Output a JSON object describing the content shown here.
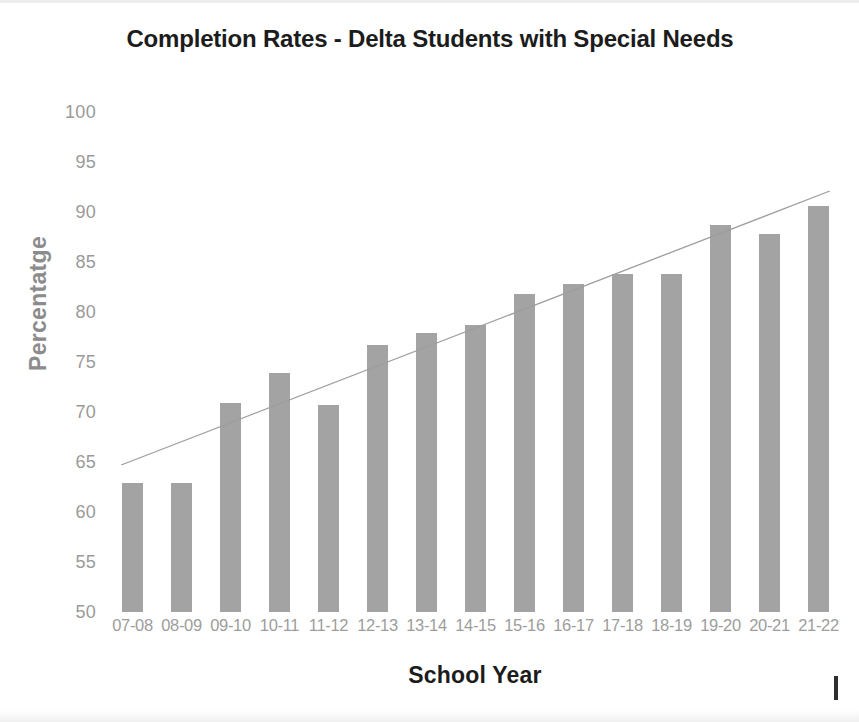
{
  "chart_data": {
    "type": "bar",
    "title": "Completion Rates - Delta Students with Special Needs",
    "xlabel": "School Year",
    "ylabel": "Percentatge",
    "categories": [
      "07-08",
      "08-09",
      "09-10",
      "10-11",
      "11-12",
      "12-13",
      "13-14",
      "14-15",
      "15-16",
      "16-17",
      "17-18",
      "18-19",
      "19-20",
      "20-21",
      "21-22"
    ],
    "values": [
      62.9,
      62.9,
      70.9,
      73.9,
      70.7,
      76.7,
      77.9,
      78.7,
      81.8,
      82.8,
      83.8,
      83.8,
      88.7,
      87.8,
      90.6
    ],
    "ylim": [
      50,
      100
    ],
    "yticks": [
      100,
      95,
      90,
      85,
      80,
      75,
      70,
      65,
      60,
      55,
      50
    ],
    "ytick_labels": [
      "100",
      "95",
      "90",
      "85",
      "80",
      "75",
      "70",
      "65",
      "60",
      "55",
      "50"
    ],
    "grid": false,
    "legend": "none",
    "series": [
      {
        "name": "Completion Rate",
        "values": [
          62.9,
          62.9,
          70.9,
          73.9,
          70.7,
          76.7,
          77.9,
          78.7,
          81.8,
          82.8,
          83.8,
          83.8,
          88.7,
          87.8,
          90.6
        ],
        "color": "#a3a3a3",
        "type": "bar"
      },
      {
        "name": "Linear Trendline",
        "type": "line",
        "color": "#9e9e9e",
        "start_value": 64.7,
        "end_value": 92.1
      }
    ],
    "annotations": []
  },
  "colors": {
    "bar": "#a3a3a3",
    "trendline": "#9e9e9e",
    "tick_label": "#9a9a9a",
    "title": "#1c1c1c",
    "axis_title_y": "#8c8c8c",
    "axis_title_x": "#1c1c1c",
    "background": "#ffffff"
  }
}
